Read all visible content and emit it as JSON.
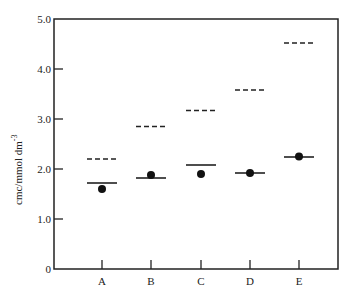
{
  "chart_data": {
    "type": "scatter",
    "title": "",
    "xlabel": "",
    "ylabel": "cmc/mmol dm⁻³",
    "ylabel_main": "cmc/mmol dm",
    "ylabel_sup": "-3",
    "ylim": [
      0,
      5.0
    ],
    "yticks": [
      "0",
      "1.0",
      "2.0",
      "3.0",
      "4.0",
      "5.0"
    ],
    "categories": [
      "A",
      "B",
      "C",
      "D",
      "E"
    ],
    "grid": false,
    "legend": null,
    "series": [
      {
        "name": "dashed line",
        "style": "dashed-bar",
        "values": [
          2.2,
          2.85,
          3.17,
          3.58,
          4.52
        ]
      },
      {
        "name": "solid line",
        "style": "solid-bar",
        "values": [
          1.72,
          1.82,
          2.08,
          1.92,
          2.24
        ]
      },
      {
        "name": "filled circle",
        "style": "dot",
        "values": [
          1.6,
          1.88,
          1.9,
          1.92,
          2.25
        ]
      }
    ]
  }
}
